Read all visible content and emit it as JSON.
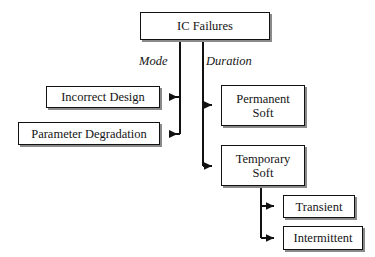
{
  "diagram": {
    "type": "hierarchy-tree",
    "background_color": "#ffffff",
    "line_color": "#111111",
    "box_fill": "#ffffff",
    "shadow_color": "#8a8a8a",
    "nodes": {
      "root": {
        "label": "IC Failures"
      },
      "incorrect_design": {
        "label": "Incorrect Design"
      },
      "parameter_degradation": {
        "label": "Parameter Degradation"
      },
      "permanent_soft": {
        "label_line1": "Permanent",
        "label_line2": "Soft"
      },
      "temporary_soft": {
        "label_line1": "Temporary",
        "label_line2": "Soft"
      },
      "transient": {
        "label": "Transient"
      },
      "intermittent": {
        "label": "Intermittent"
      }
    },
    "edge_labels": {
      "mode": "Mode",
      "duration": "Duration"
    },
    "edges": [
      {
        "from": "root",
        "to": "incorrect_design",
        "group": "Mode",
        "arrow": "left"
      },
      {
        "from": "root",
        "to": "parameter_degradation",
        "group": "Mode",
        "arrow": "left"
      },
      {
        "from": "root",
        "to": "permanent_soft",
        "group": "Duration",
        "arrow": "right"
      },
      {
        "from": "root",
        "to": "temporary_soft",
        "group": "Duration",
        "arrow": "right"
      },
      {
        "from": "temporary_soft",
        "to": "transient",
        "group": "",
        "arrow": "right"
      },
      {
        "from": "temporary_soft",
        "to": "intermittent",
        "group": "",
        "arrow": "right"
      }
    ]
  }
}
